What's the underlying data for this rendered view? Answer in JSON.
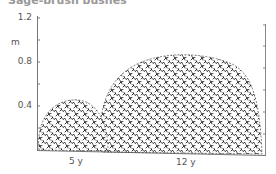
{
  "figure": {
    "title_partial": "Sage-brush bushes",
    "y_axis": {
      "unit": "m",
      "ticks": [
        {
          "label": "1.2",
          "value": 1.2
        },
        {
          "label": "0.8",
          "value": 0.8
        },
        {
          "label": "0.4",
          "value": 0.4
        }
      ]
    },
    "bushes": [
      {
        "label": "5 y",
        "height_m": 0.45
      },
      {
        "label": "12 y",
        "height_m": 0.72
      }
    ],
    "colors": {
      "ink": "#222222",
      "axis": "#777777"
    }
  }
}
